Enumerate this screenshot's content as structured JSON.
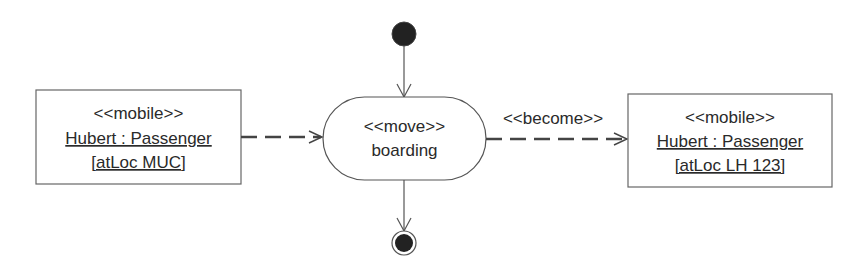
{
  "diagram": {
    "type": "UML activity diagram",
    "colors": {
      "stroke": "#555555",
      "text": "#2a2a2a",
      "node_fill": "#222222",
      "background": "#ffffff"
    },
    "initial_node": {
      "label": ""
    },
    "final_node": {
      "label": ""
    },
    "activity": {
      "stereotype": "<<move>>",
      "name": "boarding"
    },
    "left_object": {
      "stereotype": "<<mobile>>",
      "name": "Hubert : Passenger",
      "state": "[atLoc MUC]"
    },
    "right_object": {
      "stereotype": "<<mobile>>",
      "name": "Hubert : Passenger",
      "state": "[atLoc LH 123]"
    },
    "edges": {
      "become_label": "<<become>>"
    }
  }
}
